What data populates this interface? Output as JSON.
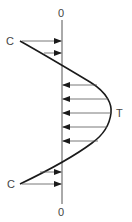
{
  "diagram": {
    "type": "stress-distribution",
    "labels": {
      "top_axis": "0",
      "bottom_axis": "0",
      "compression_top": "C",
      "compression_bottom": "C",
      "tension": "T"
    },
    "colors": {
      "line": "#1a1a1a",
      "axis": "#555555",
      "text": "#444444"
    },
    "compression_arrows_top_y": [
      41,
      53
    ],
    "tension_arrows_y": [
      85,
      99,
      113,
      127,
      141
    ],
    "compression_arrows_bottom_y": [
      172,
      184
    ]
  }
}
